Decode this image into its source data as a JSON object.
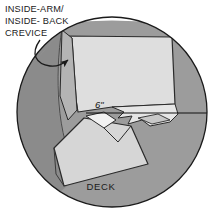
{
  "figure": {
    "shape": "circular-detail-view",
    "callout": {
      "lines": [
        "INSIDE-ARM/",
        "INSIDE- BACK",
        "CREVICE"
      ],
      "leader": "curved-arrow-pointing-down-right"
    },
    "dimension": {
      "label": "6\"",
      "rule": "horizontal-dimension-line"
    },
    "parts": {
      "deck_label": "DECK"
    },
    "colors": {
      "page_background": "#ffffff",
      "circle_fill": "#ffffff",
      "shadow_gray": "#8b8b8b",
      "mid_gray": "#9c9c9c",
      "panel_light": "#dedede",
      "panel_light_alt": "#d6d6d6",
      "outline": "#1a1a1a",
      "text": "#1a1a1a"
    },
    "geometry": {
      "circle_center_x": 112,
      "circle_center_y": 112,
      "circle_radius": 95
    }
  }
}
